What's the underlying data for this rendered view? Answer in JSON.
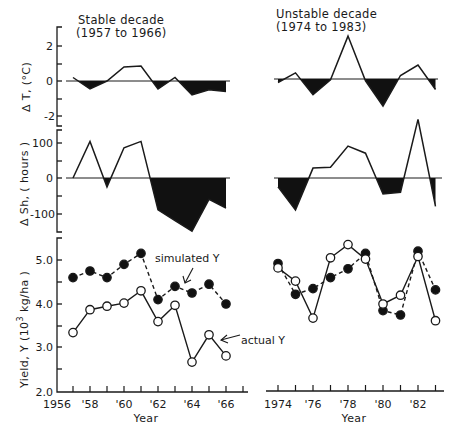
{
  "chart_data": [
    {
      "type": "area",
      "panel": "temperature-anomaly",
      "ylabel": "Δ T, (°C)",
      "ylim": [
        -2.8,
        2.8
      ],
      "yticks": [
        2,
        0,
        -2
      ],
      "yticklabels": [
        "2",
        "0",
        "-2"
      ],
      "fill_negative": true,
      "groups": [
        {
          "title_line1": "Stable decade",
          "title_line2": "(1957 to 1966)",
          "x": [
            1957,
            1958,
            1959,
            1960,
            1961,
            1962,
            1963,
            1964,
            1965,
            1966
          ],
          "values": [
            0.2,
            -0.45,
            0.0,
            0.8,
            0.85,
            -0.45,
            0.2,
            -0.8,
            -0.5,
            -0.6
          ]
        },
        {
          "title_line1": "Unstable decade",
          "title_line2": "(1974 to 1983)",
          "x": [
            1974,
            1975,
            1976,
            1977,
            1978,
            1979,
            1980,
            1981,
            1982,
            1983
          ],
          "values": [
            -0.2,
            0.35,
            -0.9,
            -0.05,
            2.45,
            -0.1,
            -1.55,
            0.2,
            0.8,
            -0.6
          ]
        }
      ]
    },
    {
      "type": "area",
      "panel": "sunshine-anomaly",
      "ylabel": "Δ Sh, ( hours )",
      "ylim": [
        -160,
        150
      ],
      "yticks": [
        100,
        0,
        -100
      ],
      "yticklabels": [
        "100",
        "0",
        "-100"
      ],
      "fill_negative": true,
      "groups": [
        {
          "x": [
            1957,
            1958,
            1959,
            1960,
            1961,
            1962,
            1963,
            1964,
            1965,
            1966
          ],
          "values": [
            0,
            103,
            -25,
            85,
            103,
            -90,
            -120,
            -150,
            -60,
            -85
          ]
        },
        {
          "x": [
            1974,
            1975,
            1976,
            1977,
            1978,
            1979,
            1980,
            1981,
            1982,
            1983
          ],
          "values": [
            -25,
            -90,
            28,
            30,
            90,
            70,
            -45,
            -40,
            165,
            -80
          ]
        }
      ]
    },
    {
      "type": "line",
      "panel": "yield",
      "ylabel": "Yield, Y (10³ kg/ha )",
      "xlabel": "Year",
      "ylim": [
        2.0,
        5.5
      ],
      "yticks": [
        2.0,
        3.0,
        4.0,
        5.0
      ],
      "yticklabels": [
        "2.0",
        "3.0",
        "4.0",
        "5.0"
      ],
      "xticklabels_left": [
        "1956",
        "'58",
        "'60",
        "'62",
        "'64",
        "'66"
      ],
      "xticklabels_right": [
        "1974",
        "'76",
        "'78",
        "'80",
        "'82"
      ],
      "annotations": [
        "simulated Y",
        "actual Y"
      ],
      "series": [
        {
          "name": "simulated Y",
          "style": "dashed, filled circles",
          "stable": {
            "x": [
              1957,
              1958,
              1959,
              1960,
              1961,
              1962,
              1963,
              1964,
              1965,
              1966
            ],
            "values": [
              4.6,
              4.75,
              4.6,
              4.9,
              5.15,
              4.1,
              4.4,
              4.25,
              4.45,
              4.0
            ]
          },
          "unstable": {
            "x": [
              1974,
              1975,
              1976,
              1977,
              1978,
              1979,
              1980,
              1981,
              1982,
              1983
            ],
            "values": [
              4.92,
              4.22,
              4.35,
              4.6,
              4.8,
              5.15,
              3.85,
              3.75,
              5.2,
              4.32
            ]
          }
        },
        {
          "name": "actual Y",
          "style": "solid, open circles",
          "stable": {
            "x": [
              1957,
              1958,
              1959,
              1960,
              1961,
              1962,
              1963,
              1964,
              1965,
              1966
            ],
            "values": [
              3.35,
              3.87,
              3.95,
              4.02,
              4.3,
              3.6,
              3.97,
              2.68,
              3.3,
              2.82
            ]
          },
          "unstable": {
            "x": [
              1974,
              1975,
              1976,
              1977,
              1978,
              1979,
              1980,
              1981,
              1982,
              1983
            ],
            "values": [
              4.82,
              4.52,
              3.68,
              5.05,
              5.35,
              5.02,
              4.0,
              4.2,
              5.08,
              3.62
            ]
          }
        }
      ]
    }
  ],
  "labels": {
    "stable_title_1": "Stable decade",
    "stable_title_2": "(1957 to 1966)",
    "unstable_title_1": "Unstable decade",
    "unstable_title_2": "(1974 to 1983)",
    "dt_ylabel": "Δ T, (°C)",
    "dsh_ylabel": "Δ Sh, ( hours )",
    "yield_ylabel_pre": "Yield, Y (10",
    "yield_ylabel_sup": "3",
    "yield_ylabel_post": " kg/ha )",
    "xlabel": "Year",
    "sim_annot": "simulated Y",
    "act_annot": "actual Y",
    "dt_ticks": [
      "2",
      "0",
      "-2"
    ],
    "dsh_ticks": [
      "100",
      "0",
      "-100"
    ],
    "y_ticks": [
      "5.0",
      "4.0",
      "3.0",
      "2.0"
    ],
    "x_left": [
      "1956",
      "'58",
      "'60",
      "'62",
      "'64",
      "'66"
    ],
    "x_right": [
      "1974",
      "'76",
      "'78",
      "'80",
      "'82"
    ]
  }
}
